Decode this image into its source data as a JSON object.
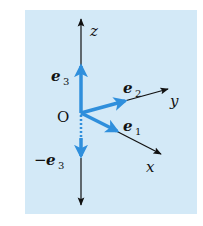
{
  "diagram": {
    "background_color": "#d3e9f7",
    "axis_color": "#111111",
    "vector_color": "#2f8fdc",
    "origin_label": "O",
    "axes": {
      "z": {
        "label": "z"
      },
      "y": {
        "label": "y"
      },
      "x": {
        "label": "x"
      }
    },
    "vectors": [
      {
        "name": "e3",
        "base": "e",
        "sub": "3",
        "prefix": ""
      },
      {
        "name": "e2",
        "base": "e",
        "sub": "2",
        "prefix": ""
      },
      {
        "name": "e1",
        "base": "e",
        "sub": "1",
        "prefix": ""
      },
      {
        "name": "neg-e3",
        "base": "e",
        "sub": "3",
        "prefix": "−"
      }
    ]
  }
}
